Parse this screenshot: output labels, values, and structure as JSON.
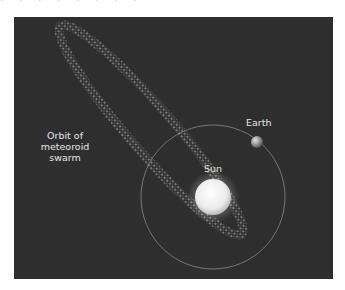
{
  "diagram": {
    "labels": {
      "swarm_line1": "Orbit of",
      "swarm_line2": "meteoroid",
      "swarm_line3": "swarm",
      "earth": "Earth",
      "sun": "Sun"
    },
    "colors": {
      "background": "#2e2e2e",
      "label": "#e6e6e6",
      "sun": "#f5f5f5",
      "earth_orbit": "#8a8a8a",
      "swarm_particles": "#c8c8c8"
    }
  }
}
